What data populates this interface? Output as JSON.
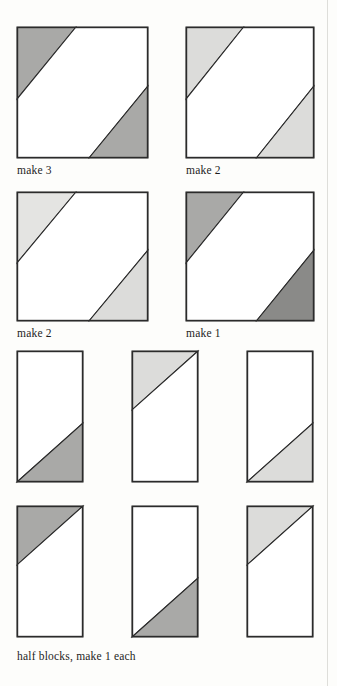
{
  "page": {
    "background_color": "#fdfdfb",
    "edge_rule_color": "#d8d8d4",
    "edge_rule_x": 327,
    "width": 337,
    "height": 686
  },
  "palette": {
    "fabric_white": "#ffffff",
    "fabric_light_gray": "#dcdcda",
    "fabric_medium_gray": "#a9a9a7",
    "fabric_dark_gray": "#8a8a88",
    "outline": "#2b2b2b",
    "text": "#1d1d1d"
  },
  "diagram": {
    "type": "quilt-block-piecing-diagram",
    "rows": [
      {
        "name": "full-block-row-1",
        "blocks": [
          {
            "id": "block-make-3",
            "shape": "square",
            "x": 17,
            "y": 27,
            "w": 131,
            "h": 131,
            "caption": "make 3",
            "caption_x": 17,
            "caption_y": 164,
            "pieces": [
              {
                "name": "top-left-triangle",
                "fill": "#a9a9a7",
                "points": "0,0 0.45,0 0,0.55"
              },
              {
                "name": "center-diagonal-band",
                "fill": "#ffffff",
                "points": "0.45,0 1,0 1,0.45 0.55,1 0,1 0,0.55"
              },
              {
                "name": "bottom-right-triangle",
                "fill": "#a9a9a7",
                "points": "1,0.45 1,1 0.55,1"
              }
            ]
          },
          {
            "id": "block-make-2-a",
            "shape": "square",
            "x": 186,
            "y": 27,
            "w": 128,
            "h": 131,
            "caption": "make 2",
            "caption_x": 186,
            "caption_y": 164,
            "pieces": [
              {
                "name": "top-left-triangle",
                "fill": "#dcdcda",
                "points": "0,0 0.45,0 0,0.55"
              },
              {
                "name": "center-diagonal-band",
                "fill": "#ffffff",
                "points": "0.45,0 1,0 1,0.45 0.55,1 0,1 0,0.55"
              },
              {
                "name": "bottom-right-triangle",
                "fill": "#dcdcda",
                "points": "1,0.45 1,1 0.55,1"
              }
            ]
          }
        ]
      },
      {
        "name": "full-block-row-2",
        "blocks": [
          {
            "id": "block-make-2-b",
            "shape": "square",
            "x": 17,
            "y": 192,
            "w": 131,
            "h": 129,
            "caption": "make 2",
            "caption_x": 17,
            "caption_y": 327,
            "pieces": [
              {
                "name": "top-left-triangle",
                "fill": "#e4e4e2",
                "points": "0,0 0.45,0 0,0.55"
              },
              {
                "name": "center-diagonal-band",
                "fill": "#ffffff",
                "points": "0.45,0 1,0 1,0.45 0.55,1 0,1 0,0.55"
              },
              {
                "name": "bottom-right-triangle",
                "fill": "#dcdcda",
                "points": "1,0.45 1,1 0.55,1"
              }
            ]
          },
          {
            "id": "block-make-1",
            "shape": "square",
            "x": 186,
            "y": 192,
            "w": 128,
            "h": 129,
            "caption": "make 1",
            "caption_x": 186,
            "caption_y": 327,
            "pieces": [
              {
                "name": "top-left-triangle",
                "fill": "#a9a9a7",
                "points": "0,0 0.45,0 0,0.55"
              },
              {
                "name": "center-diagonal-band",
                "fill": "#ffffff",
                "points": "0.45,0 1,0 1,0.45 0.55,1 0,1 0,0.55"
              },
              {
                "name": "bottom-right-triangle",
                "fill": "#8a8a88",
                "points": "1,0.45 1,1 0.55,1"
              }
            ]
          }
        ]
      },
      {
        "name": "half-block-row-1",
        "blocks": [
          {
            "id": "half-block-1",
            "shape": "half-rectangle",
            "x": 17,
            "y": 351,
            "w": 66,
            "h": 131,
            "caption": null,
            "pieces": [
              {
                "name": "upper-left-triangle",
                "fill": "#ffffff",
                "points": "0,0 1,0 1,0.55 0,1"
              },
              {
                "name": "lower-right-triangle",
                "fill": "#a9a9a7",
                "points": "1,0.55 1,1 0,1"
              }
            ]
          },
          {
            "id": "half-block-2",
            "shape": "half-rectangle",
            "x": 132,
            "y": 351,
            "w": 66,
            "h": 131,
            "caption": null,
            "pieces": [
              {
                "name": "upper-left-triangle",
                "fill": "#dcdcda",
                "points": "0,0 1,0 0,0.45"
              },
              {
                "name": "lower-right-triangle",
                "fill": "#ffffff",
                "points": "1,0 1,1 0,1 0,0.45"
              }
            ]
          },
          {
            "id": "half-block-3",
            "shape": "half-rectangle",
            "x": 247,
            "y": 351,
            "w": 66,
            "h": 131,
            "caption": null,
            "pieces": [
              {
                "name": "upper-left-triangle",
                "fill": "#ffffff",
                "points": "0,0 1,0 1,0.55 0,1"
              },
              {
                "name": "lower-right-triangle",
                "fill": "#dcdcda",
                "points": "1,0.55 1,1 0,1"
              }
            ]
          }
        ]
      },
      {
        "name": "half-block-row-2",
        "blocks": [
          {
            "id": "half-block-4",
            "shape": "half-rectangle",
            "x": 17,
            "y": 506,
            "w": 66,
            "h": 131,
            "caption": null,
            "pieces": [
              {
                "name": "upper-left-triangle",
                "fill": "#a9a9a7",
                "points": "0,0 1,0 0,0.45"
              },
              {
                "name": "lower-right-triangle",
                "fill": "#ffffff",
                "points": "1,0 1,1 0,1 0,0.45"
              }
            ]
          },
          {
            "id": "half-block-5",
            "shape": "half-rectangle",
            "x": 132,
            "y": 506,
            "w": 66,
            "h": 131,
            "caption": null,
            "pieces": [
              {
                "name": "upper-left-triangle",
                "fill": "#ffffff",
                "points": "0,0 1,0 1,0.55 0,1"
              },
              {
                "name": "lower-right-triangle",
                "fill": "#a9a9a7",
                "points": "1,0.55 1,1 0,1"
              }
            ]
          },
          {
            "id": "half-block-6",
            "shape": "half-rectangle",
            "x": 247,
            "y": 506,
            "w": 66,
            "h": 131,
            "caption": null,
            "pieces": [
              {
                "name": "upper-left-triangle",
                "fill": "#dcdcda",
                "points": "0,0 1,0 0,0.45"
              },
              {
                "name": "lower-right-triangle",
                "fill": "#ffffff",
                "points": "1,0 1,1 0,1 0,0.45"
              }
            ]
          }
        ]
      }
    ],
    "footer_caption": {
      "text": "half blocks, make 1 each",
      "x": 17,
      "y": 650
    }
  }
}
